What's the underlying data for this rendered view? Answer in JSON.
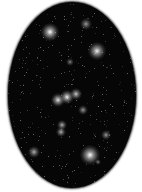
{
  "image": {
    "subject": "star-field-oval",
    "background_color": "#ffffff",
    "field_color": "#060606"
  },
  "stars": [
    {
      "x": 50,
      "y": 32,
      "r": 9,
      "brightness": 1.0
    },
    {
      "x": 97,
      "y": 51,
      "r": 9,
      "brightness": 0.95
    },
    {
      "x": 86,
      "y": 24,
      "r": 6,
      "brightness": 0.6
    },
    {
      "x": 70,
      "y": 62,
      "r": 4,
      "brightness": 0.5
    },
    {
      "x": 58,
      "y": 100,
      "r": 7,
      "brightness": 0.9
    },
    {
      "x": 67,
      "y": 97,
      "r": 7,
      "brightness": 0.95
    },
    {
      "x": 76,
      "y": 94,
      "r": 6,
      "brightness": 0.8
    },
    {
      "x": 83,
      "y": 110,
      "r": 5,
      "brightness": 0.6
    },
    {
      "x": 62,
      "y": 125,
      "r": 5,
      "brightness": 0.7
    },
    {
      "x": 61,
      "y": 132,
      "r": 5,
      "brightness": 0.7
    },
    {
      "x": 106,
      "y": 135,
      "r": 5,
      "brightness": 0.6
    },
    {
      "x": 90,
      "y": 155,
      "r": 10,
      "brightness": 1.0
    },
    {
      "x": 34,
      "y": 152,
      "r": 6,
      "brightness": 0.7
    },
    {
      "x": 98,
      "y": 162,
      "r": 3,
      "brightness": 0.5
    }
  ]
}
